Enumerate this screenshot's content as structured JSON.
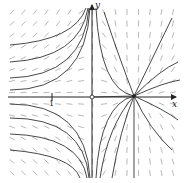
{
  "figure": {
    "type": "phase-portrait",
    "axes": {
      "x_label": "x",
      "y_label": "y",
      "tick_label": "1"
    },
    "equilibria": [
      {
        "kind": "saddle",
        "at": "origin"
      },
      {
        "kind": "unstable-node",
        "at": "positive x-axis"
      }
    ],
    "colors": {
      "trajectory": "#333333",
      "field": "#9a9a9a",
      "axis": "#222222"
    }
  }
}
